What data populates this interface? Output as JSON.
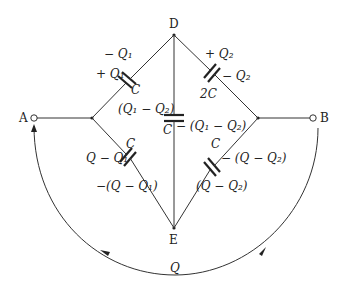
{
  "diagram": {
    "type": "capacitor-bridge-circuit",
    "nodes": {
      "A": "A",
      "B": "B",
      "D": "D",
      "E": "E"
    },
    "capacitors": {
      "AD": {
        "value": "C",
        "charge_near": "+ Q₁",
        "charge_far": "− Q₁"
      },
      "DB": {
        "value": "2C",
        "charge_near": "+ Q₂",
        "charge_far": "− Q₂"
      },
      "DE": {
        "value": "C",
        "charge_top": "(Q₁ − Q₂)",
        "charge_bottom": "− (Q₁ − Q₂)"
      },
      "AE": {
        "value": "C",
        "charge_top": "Q − Q₁",
        "charge_bottom": "−(Q − Q₁)"
      },
      "EB": {
        "value": "C",
        "charge_top": "− (Q − Q₂)",
        "charge_bottom": "(Q − Q₂)"
      }
    },
    "return_path": {
      "label": "Q",
      "direction": "B to A"
    },
    "colors": {
      "line": "#333333",
      "text": "#222222",
      "background": "#ffffff"
    }
  }
}
